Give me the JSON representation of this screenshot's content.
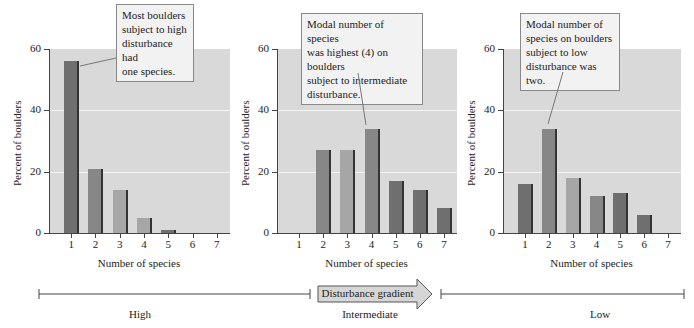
{
  "chart_data": [
    {
      "type": "bar",
      "title": "High disturbance",
      "xlabel": "Number of species",
      "ylabel": "Percent of boulders",
      "categories": [
        "1",
        "2",
        "3",
        "4",
        "5",
        "6",
        "7"
      ],
      "values": [
        56,
        21,
        14,
        5,
        1,
        0,
        0
      ],
      "yticks": [
        "0",
        "20",
        "40",
        "60"
      ],
      "ylim": [
        0,
        60
      ],
      "grid": true,
      "annotation": "Most boulders subject to high disturbance had one species."
    },
    {
      "type": "bar",
      "title": "Intermediate disturbance",
      "xlabel": "Number of species",
      "ylabel": "Percent of boulders",
      "categories": [
        "1",
        "2",
        "3",
        "4",
        "5",
        "6",
        "7"
      ],
      "values": [
        0,
        27,
        27,
        34,
        17,
        14,
        8
      ],
      "yticks": [
        "0",
        "20",
        "40",
        "60"
      ],
      "ylim": [
        0,
        60
      ],
      "grid": true,
      "annotation": "Modal number of species was highest (4) on boulders subject to intermediate disturbance."
    },
    {
      "type": "bar",
      "title": "Low disturbance",
      "xlabel": "Number of species",
      "ylabel": "Percent of boulders",
      "categories": [
        "1",
        "2",
        "3",
        "4",
        "5",
        "6",
        "7"
      ],
      "values": [
        16,
        34,
        18,
        12,
        13,
        6,
        0
      ],
      "yticks": [
        "0",
        "20",
        "40",
        "60"
      ],
      "ylim": [
        0,
        60
      ],
      "grid": true,
      "annotation": "Modal number of species on boulders subject to low disturbance was two."
    }
  ],
  "panels": [
    {
      "ylabel": "Percent of boulders",
      "xlabel": "Number of species",
      "callout": [
        "Most boulders",
        "subject to high",
        "disturbance had",
        "one species."
      ]
    },
    {
      "ylabel": "Percent of boulders",
      "xlabel": "Number of species",
      "callout": [
        "Modal number of species",
        "was highest (4) on boulders",
        "subject to intermediate",
        "disturbance."
      ]
    },
    {
      "ylabel": "Percent of boulders",
      "xlabel": "Number of species",
      "callout": [
        "Modal number of",
        "species on boulders",
        "subject to low",
        "disturbance was two."
      ]
    }
  ],
  "gradient": {
    "arrow_label": "Disturbance gradient",
    "levels": [
      "High",
      "Intermediate",
      "Low"
    ]
  },
  "colors": {
    "plot_bg": "#d9d9d9",
    "bar_dark": "#6f6f6f",
    "bar_mid": "#878787",
    "bar_light": "#a6a6a6"
  }
}
